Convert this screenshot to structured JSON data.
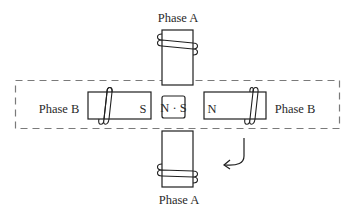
{
  "diagram": {
    "type": "stepper-motor-phase-diagram",
    "labels": {
      "phase_a_top": "Phase A",
      "phase_a_bottom": "Phase A",
      "phase_b_left": "Phase B",
      "phase_b_right": "Phase B",
      "left_pole_polarity": "S",
      "right_pole_polarity": "N",
      "rotor": "N · S"
    },
    "colors": {
      "stroke": "#1f1f1f",
      "dashed_box": "#7a7a7a",
      "text": "#2a2a2a",
      "background": "#ffffff"
    },
    "rotation_arrow": "clockwise-curved-arrow"
  }
}
